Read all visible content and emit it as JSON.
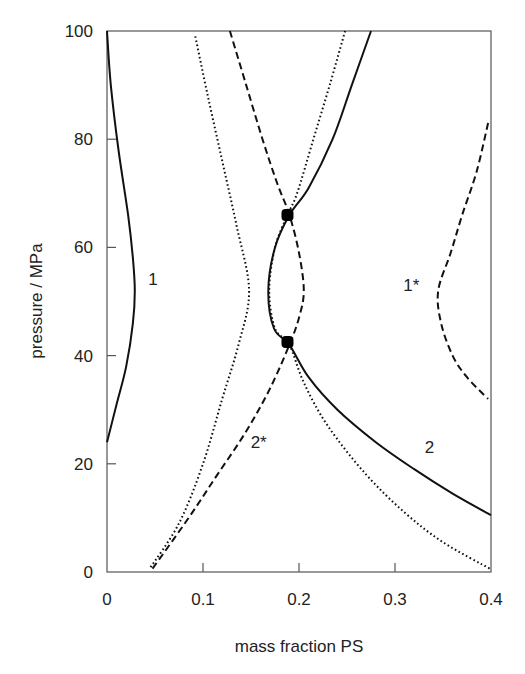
{
  "chart_data": {
    "type": "line",
    "title": "",
    "xlabel": "mass fraction PS",
    "ylabel": "pressure / MPa",
    "xlim": [
      0,
      0.4
    ],
    "ylim": [
      0,
      100
    ],
    "grid": false,
    "legend": "none (curves labelled inline)",
    "x_ticks": [
      "0",
      "0.1",
      "0.2",
      "0.3",
      "0.4"
    ],
    "y_ticks": [
      "0",
      "20",
      "40",
      "60",
      "80",
      "100"
    ],
    "series": [
      {
        "name": "1",
        "style": "solid",
        "points": [
          [
            0.0,
            100
          ],
          [
            0.004,
            90
          ],
          [
            0.012,
            78
          ],
          [
            0.022,
            66
          ],
          [
            0.027,
            58
          ],
          [
            0.029,
            52
          ],
          [
            0.027,
            46
          ],
          [
            0.02,
            38
          ],
          [
            0.01,
            31
          ],
          [
            0.0,
            24
          ]
        ]
      },
      {
        "name": "1*",
        "style": "dashed",
        "points": [
          [
            0.397,
            83
          ],
          [
            0.385,
            74
          ],
          [
            0.37,
            66
          ],
          [
            0.358,
            59
          ],
          [
            0.345,
            52
          ],
          [
            0.348,
            46
          ],
          [
            0.36,
            40
          ],
          [
            0.375,
            36
          ],
          [
            0.397,
            32
          ]
        ]
      },
      {
        "name": "2",
        "style": "solid",
        "points": [
          [
            0.275,
            100
          ],
          [
            0.255,
            90
          ],
          [
            0.235,
            80
          ],
          [
            0.21,
            71
          ],
          [
            0.19,
            66
          ],
          [
            0.175,
            60
          ],
          [
            0.168,
            52
          ],
          [
            0.174,
            45
          ],
          [
            0.19,
            42
          ],
          [
            0.21,
            36
          ],
          [
            0.24,
            30
          ],
          [
            0.28,
            24
          ],
          [
            0.32,
            19
          ],
          [
            0.36,
            14.5
          ],
          [
            0.4,
            10.5
          ]
        ]
      },
      {
        "name": "2*",
        "style": "dashed",
        "points": [
          [
            0.128,
            100
          ],
          [
            0.145,
            90
          ],
          [
            0.162,
            80
          ],
          [
            0.177,
            72
          ],
          [
            0.19,
            66
          ],
          [
            0.2,
            59
          ],
          [
            0.205,
            52
          ],
          [
            0.2,
            47
          ],
          [
            0.19,
            42
          ],
          [
            0.17,
            34
          ],
          [
            0.145,
            26
          ],
          [
            0.115,
            18
          ],
          [
            0.085,
            10
          ],
          [
            0.047,
            0.5
          ]
        ]
      },
      {
        "name": "dotted (unlabelled)",
        "style": "dotted",
        "points": [
          [
            0.092,
            99
          ],
          [
            0.105,
            88
          ],
          [
            0.12,
            76
          ],
          [
            0.135,
            64
          ],
          [
            0.148,
            52
          ],
          [
            0.137,
            42
          ],
          [
            0.12,
            32
          ],
          [
            0.1,
            20
          ],
          [
            0.075,
            9
          ],
          [
            0.044,
            0.5
          ]
        ]
      },
      {
        "name": "dotted right (unlabelled)",
        "style": "dotted",
        "points": [
          [
            0.248,
            100
          ],
          [
            0.232,
            90
          ],
          [
            0.215,
            80
          ],
          [
            0.198,
            70
          ],
          [
            0.188,
            66
          ],
          [
            0.175,
            60
          ],
          [
            0.169,
            52
          ],
          [
            0.175,
            45
          ],
          [
            0.19,
            42
          ],
          [
            0.205,
            35
          ],
          [
            0.23,
            27
          ],
          [
            0.27,
            18
          ],
          [
            0.31,
            11
          ],
          [
            0.35,
            5.5
          ],
          [
            0.4,
            0.5
          ]
        ]
      }
    ],
    "critical_points": [
      {
        "x": 0.188,
        "y": 66
      },
      {
        "x": 0.188,
        "y": 42.5
      }
    ],
    "annotations": [
      {
        "text": "1",
        "x": 0.048,
        "y": 53
      },
      {
        "text": "1*",
        "x": 0.317,
        "y": 52
      },
      {
        "text": "2*",
        "x": 0.158,
        "y": 23
      },
      {
        "text": "2",
        "x": 0.336,
        "y": 22
      }
    ]
  }
}
